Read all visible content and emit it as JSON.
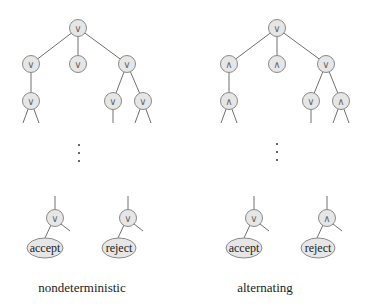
{
  "diagram": {
    "colors": {
      "node_fill": "#e6e6e6",
      "node_stroke": "#8a8a8a",
      "edge": "#707070",
      "text": "#222222"
    },
    "trees": [
      {
        "caption": "nondeterministic",
        "top": {
          "root": "∨",
          "level2": [
            "∨",
            "∨",
            "∨"
          ],
          "level3": [
            "∨",
            "∨",
            "∨"
          ]
        },
        "ellipsis": "⋮",
        "bottom": [
          {
            "op": "∨",
            "leaf": "accept"
          },
          {
            "op": "∨",
            "leaf": "reject"
          }
        ]
      },
      {
        "caption": "alternating",
        "top": {
          "root": "∨",
          "level2": [
            "∧",
            "∧",
            "∨"
          ],
          "level3": [
            "∧",
            "∨",
            "∧"
          ]
        },
        "ellipsis": "⋮",
        "bottom": [
          {
            "op": "∨",
            "leaf": "accept"
          },
          {
            "op": "∧",
            "leaf": "reject"
          }
        ]
      }
    ]
  }
}
